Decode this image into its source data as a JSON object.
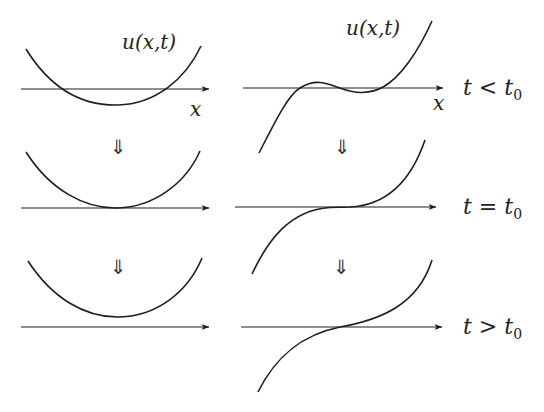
{
  "figure": {
    "function_label": "u(x,t)",
    "axis_label": "x",
    "transition_arrow": "⇓",
    "rows": [
      {
        "time_label_t": "t",
        "time_label_op": "<",
        "time_label_t0": "t",
        "time_label_sub": "0",
        "time_label": "t < t0"
      },
      {
        "time_label_t": "t",
        "time_label_op": "=",
        "time_label_t0": "t",
        "time_label_sub": "0",
        "time_label": "t = t0"
      },
      {
        "time_label_t": "t",
        "time_label_op": ">",
        "time_label_t0": "t",
        "time_label_sub": "0",
        "time_label": "t > t0"
      }
    ],
    "left_column": {
      "curve_type": "parabola",
      "states": [
        "two roots (crosses axis)",
        "double root (tangent to axis)",
        "no real roots (above axis)"
      ]
    },
    "right_column": {
      "curve_type": "cubic",
      "states": [
        "three roots",
        "triple root (inflection tangent to axis)",
        "single root"
      ]
    },
    "colors": {
      "stroke": "#1e1e1e",
      "background": "#ffffff"
    }
  }
}
